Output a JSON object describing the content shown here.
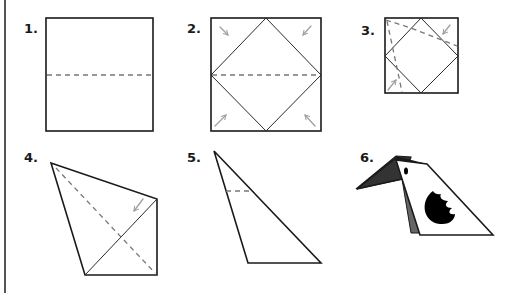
{
  "diagram": {
    "steps": [
      {
        "number": "1.",
        "description": "square with horizontal fold line"
      },
      {
        "number": "2.",
        "description": "fold corners to center"
      },
      {
        "number": "3.",
        "description": "fold edges toward diagonal"
      },
      {
        "number": "4.",
        "description": "kite shape with diagonal fold"
      },
      {
        "number": "5.",
        "description": "triangle with small fold"
      },
      {
        "number": "6.",
        "description": "finished bird"
      }
    ],
    "colors": {
      "outline": "#1a1a1a",
      "fold_line": "#777777",
      "arrow": "#a0a0a0",
      "wing_shadow": "#666666",
      "marking": "#000000"
    },
    "icons": {
      "fold_arrow": "arrow-icon",
      "bird": "bird-icon"
    }
  }
}
